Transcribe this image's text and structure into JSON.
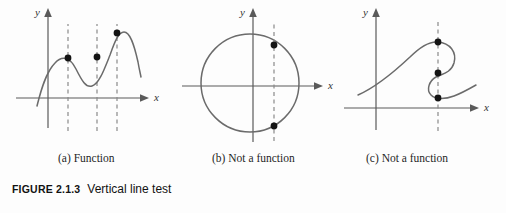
{
  "figure": {
    "tag": "FIGURE 2.1.3",
    "title": "Vertical line test",
    "background_color": "#fdfdfd",
    "curve_color": "#6b6b6b",
    "axis_color": "#5a5a5a",
    "dash_color": "#8a8a8a",
    "dot_color": "#141414"
  },
  "panels": [
    {
      "id": "a",
      "caption": "(a) Function",
      "x_axis_label": "x",
      "y_axis_label": "y",
      "curve_type": "wavy-cubic",
      "vertical_lines": 3,
      "intersections_per_line": [
        1,
        1,
        1
      ],
      "dots": [
        {
          "x": 60,
          "y": 58
        },
        {
          "x": 89,
          "y": 57
        },
        {
          "x": 109,
          "y": 33
        }
      ]
    },
    {
      "id": "b",
      "caption": "(b) Not a function",
      "x_axis_label": "x",
      "y_axis_label": "y",
      "curve_type": "circle",
      "vertical_lines": 1,
      "intersections_per_line": [
        2
      ],
      "dots": [
        {
          "x": 96,
          "y": 45
        },
        {
          "x": 96,
          "y": 126
        }
      ]
    },
    {
      "id": "c",
      "caption": "(c) Not a function",
      "x_axis_label": "x",
      "y_axis_label": "y",
      "curve_type": "s-curve",
      "vertical_lines": 1,
      "intersections_per_line": [
        3
      ],
      "dots": [
        {
          "x": 102,
          "y": 42
        },
        {
          "x": 102,
          "y": 73
        },
        {
          "x": 102,
          "y": 98
        }
      ]
    }
  ]
}
